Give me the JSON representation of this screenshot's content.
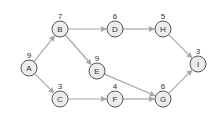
{
  "nodes": [
    {
      "id": "A",
      "label": "A",
      "weight": "9",
      "x": 29,
      "y": 68
    },
    {
      "id": "B",
      "label": "B",
      "weight": "7",
      "x": 60,
      "y": 29
    },
    {
      "id": "C",
      "label": "C",
      "weight": "3",
      "x": 60,
      "y": 99
    },
    {
      "id": "D",
      "label": "D",
      "weight": "6",
      "x": 115,
      "y": 29
    },
    {
      "id": "E",
      "label": "E",
      "weight": "9",
      "x": 97,
      "y": 71
    },
    {
      "id": "F",
      "label": "F",
      "weight": "4",
      "x": 115,
      "y": 99
    },
    {
      "id": "G",
      "label": "G",
      "weight": "6",
      "x": 163,
      "y": 99
    },
    {
      "id": "H",
      "label": "H",
      "weight": "5",
      "x": 163,
      "y": 29
    },
    {
      "id": "I",
      "label": "I",
      "weight": "3",
      "x": 198,
      "y": 64
    }
  ],
  "edges": [
    {
      "from": "A",
      "to": "B"
    },
    {
      "from": "A",
      "to": "C"
    },
    {
      "from": "B",
      "to": "D"
    },
    {
      "from": "B",
      "to": "E"
    },
    {
      "from": "E",
      "to": "G"
    },
    {
      "from": "C",
      "to": "F"
    },
    {
      "from": "F",
      "to": "G"
    },
    {
      "from": "D",
      "to": "H"
    },
    {
      "from": "H",
      "to": "I"
    },
    {
      "from": "G",
      "to": "I"
    }
  ],
  "colors": {
    "node_fill": "#ececec",
    "node_stroke": "#555555",
    "edge": "#a8a8a8"
  }
}
